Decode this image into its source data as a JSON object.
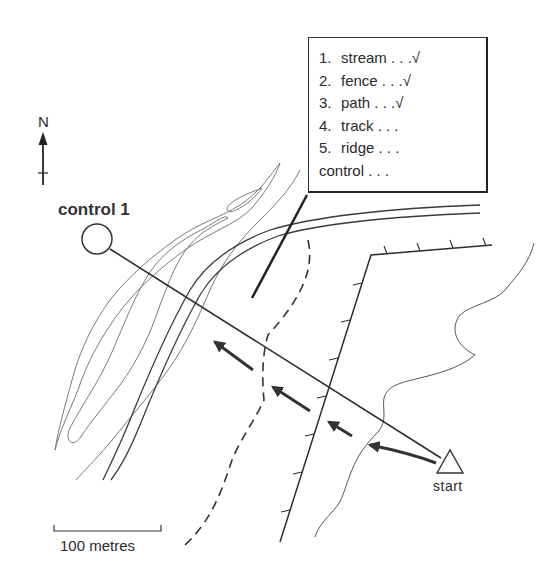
{
  "map": {
    "north_label": "N",
    "control_label": "control 1",
    "start_label": "start",
    "scale_label": "100 metres"
  },
  "checklist": {
    "items": [
      {
        "num": "1.",
        "text": "stream . . .√"
      },
      {
        "num": "2.",
        "text": "fence . . .√"
      },
      {
        "num": "3.",
        "text": "path . . .√"
      },
      {
        "num": "4.",
        "text": "track . . ."
      },
      {
        "num": "5.",
        "text": "ridge . . ."
      }
    ],
    "final": "control . . ."
  },
  "colors": {
    "ink": "#2a2a2a",
    "contour": "#777777",
    "background": "#ffffff"
  }
}
